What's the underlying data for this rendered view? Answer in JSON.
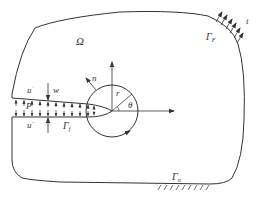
{
  "diagram": {
    "type": "fracture-mechanics-domain",
    "colors": {
      "stroke": "#333333",
      "background": "#ffffff"
    },
    "labels": {
      "domain": "Ω",
      "traction_boundary": "Γ",
      "traction_boundary_sub": "F",
      "traction": "t",
      "displacement_boundary": "Γ",
      "displacement_boundary_sub": "u",
      "crack_face_boundary": "Γ",
      "crack_face_boundary_sub": "f",
      "upper_face_disp": "u",
      "upper_face_sup": "+",
      "lower_face_disp": "u",
      "lower_face_sup": "−",
      "opening": "w",
      "pressure": "P",
      "normal": "n",
      "radius": "r",
      "angle": "θ"
    }
  }
}
